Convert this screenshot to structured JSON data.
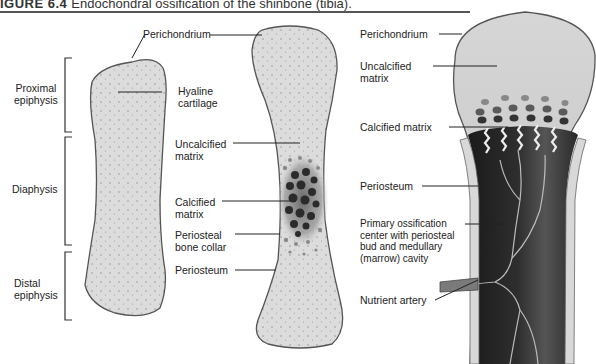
{
  "figure": {
    "number": "IGURE 6.4",
    "caption": "Endochondral ossification of the shinbone (tibia)."
  },
  "colors": {
    "cartilage": "#dcdcdc",
    "outline": "#555555",
    "calcified": "#2a2a2a",
    "marrow": "#1f1f1f",
    "bone_collar": "#d8d8d8"
  },
  "panels": [
    {
      "id": "stage-1",
      "description": "Hyaline cartilage model",
      "region_labels": [
        {
          "text_1": "Proximal",
          "text_2": "epiphysis"
        },
        {
          "text_1": "Diaphysis"
        },
        {
          "text_1": "Distal",
          "text_2": "epiphysis"
        }
      ],
      "labels": [
        {
          "text_1": "Hyaline",
          "text_2": "cartilage"
        }
      ]
    },
    {
      "id": "stage-2",
      "description": "Calcification of diaphysis and periosteal bone collar",
      "labels": [
        {
          "text": "Perichondrium"
        },
        {
          "text_1": "Uncalcified",
          "text_2": "matrix"
        },
        {
          "text_1": "Calcified",
          "text_2": "matrix"
        },
        {
          "text_1": "Periosteal",
          "text_2": "bone collar"
        },
        {
          "text": "Periosteum"
        }
      ]
    },
    {
      "id": "stage-3",
      "description": "Primary ossification center with nutrient artery",
      "labels": [
        {
          "text": "Perichondrium"
        },
        {
          "text_1": "Uncalcified",
          "text_2": "matrix"
        },
        {
          "text": "Calcified  matrix"
        },
        {
          "text": "Periosteum"
        },
        {
          "text_1": "Primary ossification",
          "text_2": "center with periosteal",
          "text_3": "bud and medullary",
          "text_4": "(marrow) cavity"
        },
        {
          "text": "Nutrient artery"
        }
      ]
    }
  ]
}
